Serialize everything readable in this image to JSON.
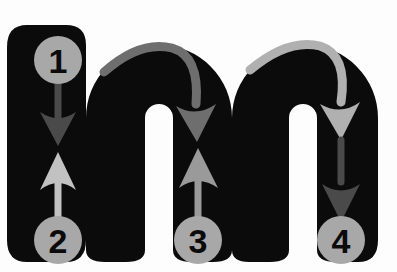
{
  "figure": {
    "kind": "letter-stroke-order-diagram",
    "letter": "m",
    "letter_case": "lowercase",
    "background_color": "#fdfdfd",
    "letter_color": "#0b0b0b"
  },
  "palette": {
    "letter_black": "#0b0b0b",
    "circle_gray": "#a8a8a8",
    "numeral_black": "#0b0b0b",
    "arrow_dark": "#4a4a4a",
    "arrow_medium": "#6e6e6e",
    "arrow_light": "#9a9a9a",
    "arrow_pale": "#c2c2c2",
    "background": "#fdfdfd"
  },
  "stroke_markers": [
    {
      "id": "marker-1",
      "label": "1",
      "cx": 58,
      "cy": 60,
      "r": 24,
      "fill": "#a8a8a8",
      "text_color": "#0b0b0b",
      "position": "top of left stem",
      "role": "start of stroke 1"
    },
    {
      "id": "marker-2",
      "label": "2",
      "cx": 58,
      "cy": 240,
      "r": 24,
      "fill": "#a8a8a8",
      "text_color": "#0b0b0b",
      "position": "bottom of left stem",
      "role": "start of stroke 2"
    },
    {
      "id": "marker-3",
      "label": "3",
      "cx": 198,
      "cy": 240,
      "r": 24,
      "fill": "#a8a8a8",
      "text_color": "#0b0b0b",
      "position": "bottom of middle stem",
      "role": "start of stroke 3"
    },
    {
      "id": "marker-4",
      "label": "4",
      "cx": 341,
      "cy": 240,
      "r": 24,
      "fill": "#a8a8a8",
      "text_color": "#0b0b0b",
      "position": "bottom of right stem",
      "role": "end of stroke 4"
    }
  ],
  "arrows": [
    {
      "id": "arrow-down-stem1",
      "direction": "down",
      "color": "#4a4a4a",
      "from_marker": "1",
      "description": "Straight down arrow inside the left stem, from circle 1 toward the middle"
    },
    {
      "id": "arrow-up-stem1",
      "direction": "up",
      "color": "#c2c2c2",
      "to_marker": "2",
      "description": "Straight up arrow inside the left stem, rising from circle 2"
    },
    {
      "id": "arrow-arc-hump1",
      "direction": "clockwise-arc",
      "color": "#6e6e6e",
      "description": "Curved arrow arcing over the first hump, ending pointing down into the middle stem"
    },
    {
      "id": "arrow-up-stem2",
      "direction": "up",
      "color": "#9a9a9a",
      "to_marker": "3",
      "description": "Straight up arrow inside the middle stem, rising from circle 3"
    },
    {
      "id": "arrow-arc-hump2",
      "direction": "clockwise-arc",
      "color": "#b0b0b0",
      "description": "Curved arrow arcing over the second hump, ending pointing down into the right stem"
    },
    {
      "id": "arrow-down-stem3",
      "direction": "down",
      "color": "#4a4a4a",
      "to_marker": "4",
      "description": "Straight down arrow inside the right stem, descending toward circle 4"
    }
  ],
  "stroke_sequence": [
    {
      "step": 1,
      "label": "1",
      "instruction": "Start at the top of the left stem and pull straight down"
    },
    {
      "step": 2,
      "label": "2",
      "instruction": "Retrace up the left stem, then arc over to form the first hump and come down"
    },
    {
      "step": 3,
      "label": "3",
      "instruction": "Retrace up the middle stem, then arc over to form the second hump and come down"
    },
    {
      "step": 4,
      "label": "4",
      "instruction": "Finish at the bottom of the right stem"
    }
  ]
}
